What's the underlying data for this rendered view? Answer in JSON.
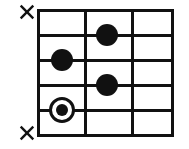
{
  "diagram": {
    "kind": "guitar-chord-diagram",
    "orientation": "horizontal",
    "background_color": "#ffffff",
    "ink_color": "#111111",
    "grid": {
      "left": 38,
      "top": 10,
      "right": 172,
      "bottom": 135,
      "width": 134,
      "height": 125,
      "line_thickness": 3,
      "string_count": 6,
      "fret_count": 3,
      "string_line_y": [
        10,
        35,
        60,
        85,
        110,
        135
      ],
      "fret_line_x": [
        38,
        85,
        132,
        172
      ]
    },
    "muted_markers": [
      {
        "name": "x-mark-top",
        "glyph": "×",
        "x": 18,
        "y": 3,
        "size": 18,
        "string_index": 0
      },
      {
        "name": "x-mark-bottom",
        "glyph": "×",
        "x": 18,
        "y": 124,
        "size": 18,
        "string_index": 5
      }
    ],
    "fingered_notes": [
      {
        "name": "dot-fret2-string1",
        "cx": 107,
        "cy": 35,
        "r": 11,
        "style": "filled",
        "fret": 2,
        "string_index": 1
      },
      {
        "name": "dot-fret1-string2",
        "cx": 62,
        "cy": 60,
        "r": 11,
        "style": "filled",
        "fret": 1,
        "string_index": 2
      },
      {
        "name": "dot-fret2-string3",
        "cx": 107,
        "cy": 85,
        "r": 11,
        "style": "filled",
        "fret": 2,
        "string_index": 3
      },
      {
        "name": "dot-fret1-string4-root",
        "cx": 62,
        "cy": 110,
        "r": 13,
        "inner_r": 6,
        "style": "ringed",
        "fret": 1,
        "string_index": 4
      }
    ]
  }
}
